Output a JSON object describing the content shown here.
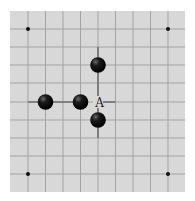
{
  "diagram": {
    "type": "go-board-fragment",
    "board": {
      "x": 10,
      "y": 11,
      "width": 175,
      "height": 181,
      "background": "#d8d8d8",
      "grid_color": "#a3a3a3",
      "highlight_line_color": "#6e6e6e",
      "vertical_lines_x": [
        28,
        45.5,
        63,
        80.5,
        98,
        115.5,
        133,
        150.5,
        168
      ],
      "horizontal_lines_y": [
        29,
        47,
        65,
        83,
        102,
        120,
        138,
        156,
        174
      ]
    },
    "star_points": [
      {
        "col": 0,
        "row": 0
      },
      {
        "col": 8,
        "row": 0
      },
      {
        "col": 0,
        "row": 8
      },
      {
        "col": 8,
        "row": 8
      }
    ],
    "stones": [
      {
        "color": "black",
        "col": 4,
        "row": 2
      },
      {
        "color": "black",
        "col": 1,
        "row": 4
      },
      {
        "color": "black",
        "col": 3,
        "row": 4
      },
      {
        "color": "black",
        "col": 4,
        "row": 5
      }
    ],
    "labels": [
      {
        "text": "A",
        "col": 4,
        "row": 4
      }
    ],
    "highlight_segments": [
      {
        "from": {
          "col": 0,
          "row": 4
        },
        "to": {
          "col": 3,
          "row": 4
        }
      },
      {
        "from": {
          "col": 4,
          "row": 1
        },
        "to": {
          "col": 4,
          "row": 4
        }
      },
      {
        "from": {
          "col": 4,
          "row": 4
        },
        "to": {
          "col": 4,
          "row": 6
        }
      },
      {
        "from": {
          "col": 4,
          "row": 4
        },
        "to": {
          "col": 5,
          "row": 4
        }
      }
    ]
  }
}
